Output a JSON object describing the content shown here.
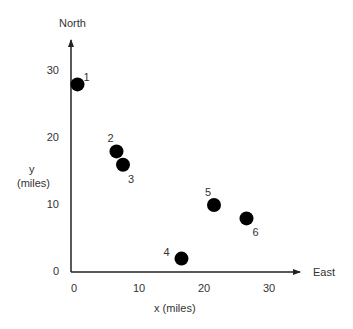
{
  "chart_data": {
    "type": "scatter",
    "title": "",
    "xlabel": "x (miles)",
    "ylabel": "y\n(miles)",
    "x_axis_end_label": "East",
    "y_axis_end_label": "North",
    "xlim": [
      0,
      35
    ],
    "ylim": [
      0,
      35
    ],
    "x_ticks": [
      0,
      10,
      20,
      30
    ],
    "y_ticks": [
      0,
      10,
      20,
      30
    ],
    "grid": false,
    "legend": null,
    "series": [
      {
        "name": "locations",
        "points": [
          {
            "label": "1",
            "x": 1,
            "y": 28
          },
          {
            "label": "2",
            "x": 7,
            "y": 18
          },
          {
            "label": "3",
            "x": 8,
            "y": 16
          },
          {
            "label": "4",
            "x": 17,
            "y": 2
          },
          {
            "label": "5",
            "x": 22,
            "y": 10
          },
          {
            "label": "6",
            "x": 27,
            "y": 8
          }
        ]
      }
    ]
  },
  "labels": {
    "north": "North",
    "east": "East",
    "y_line1": "y",
    "y_line2": "(miles)",
    "x_label": "x (miles)"
  },
  "colors": {
    "axis": "#222222",
    "point": "#000000",
    "text": "#333333"
  }
}
